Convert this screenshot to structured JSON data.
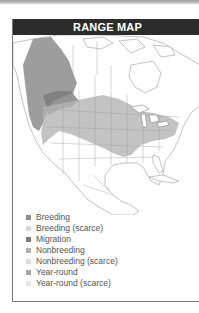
{
  "title": "RANGE MAP",
  "colors": {
    "title_bar": "#2b2b2b",
    "breeding": "#8c8c8c",
    "breeding_scarce": "#d6d6d6",
    "migration": "#7a7a7a",
    "nonbreeding": "#b4b4b4",
    "nonbreeding_scarce": "#dcdcdc",
    "year_round": "#a6a6a6",
    "year_round_scarce": "#e6e6e6"
  },
  "legend": {
    "items": [
      {
        "label": "Breeding",
        "color": "#8c8c8c"
      },
      {
        "label": "Breeding (scarce)",
        "color": "#d6d6d6"
      },
      {
        "label": "Migration",
        "color": "#7a7a7a"
      },
      {
        "label": "Nonbreeding",
        "color": "#b4b4b4"
      },
      {
        "label": "Nonbreeding (scarce)",
        "color": "#dcdcdc"
      },
      {
        "label": "Year-round",
        "color": "#a6a6a6"
      },
      {
        "label": "Year-round (scarce)",
        "color": "#e6e6e6"
      }
    ]
  }
}
